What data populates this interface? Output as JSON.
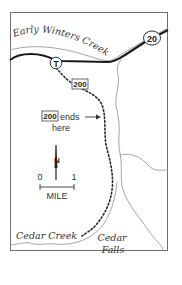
{
  "map": {
    "labels": {
      "river_top": "Early Winters Creek",
      "creek_bottom": "Cedar Creek",
      "falls_line1": "Cedar",
      "falls_line2": "Falls"
    },
    "highway_shield": "20",
    "trailhead_symbol": "T",
    "trail_marker": "200",
    "trail_end": {
      "marker": "200",
      "text_line1": "ends",
      "text_line2": "here"
    },
    "north_arrow": "N",
    "scale": {
      "start": "0",
      "end": "1",
      "unit": "MILE"
    },
    "colors": {
      "road": "#1a1a1a",
      "stream": "#9a9a9a",
      "frame": "#6e6e6e",
      "trail": "#2a2a2a",
      "text": "#333333"
    }
  }
}
